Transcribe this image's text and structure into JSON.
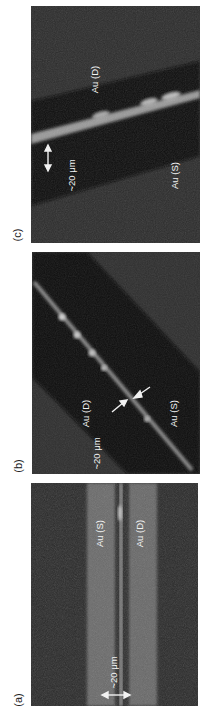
{
  "figure": {
    "orientation": "rotated 90deg counter-clockwise",
    "panels": [
      {
        "id": "c",
        "label": "(c)",
        "annotations": {
          "electrode_top": "Au (D)",
          "electrode_bottom": "Au (S)",
          "scale": "~20 μm"
        },
        "description": "diagonal bright channel between dark gap, with double arrow scale marker"
      },
      {
        "id": "b",
        "label": "(b)",
        "annotations": {
          "electrode_top": "Au (D)",
          "electrode_bottom": "Au (S)",
          "scale": "~20 μm"
        },
        "description": "thin diagonal bright wire across dark gap, two arrows pointing to wire"
      },
      {
        "id": "a",
        "label": "(a)",
        "annotations": {
          "electrode_left": "Au (S)",
          "electrode_right": "Au (D)",
          "scale": "~20 μm"
        },
        "description": "two parallel vertical bright stripes with a thin bright line in the gap, double arrow scale marker"
      }
    ],
    "colors": {
      "background": "#ffffff",
      "image_dark": "#1a1a1a",
      "image_mid": "#3a3a3a",
      "electrode": "#6e6e6e",
      "highlight": "#d8d8d8",
      "text": "#f2f2f2",
      "label_text": "#222222"
    }
  }
}
